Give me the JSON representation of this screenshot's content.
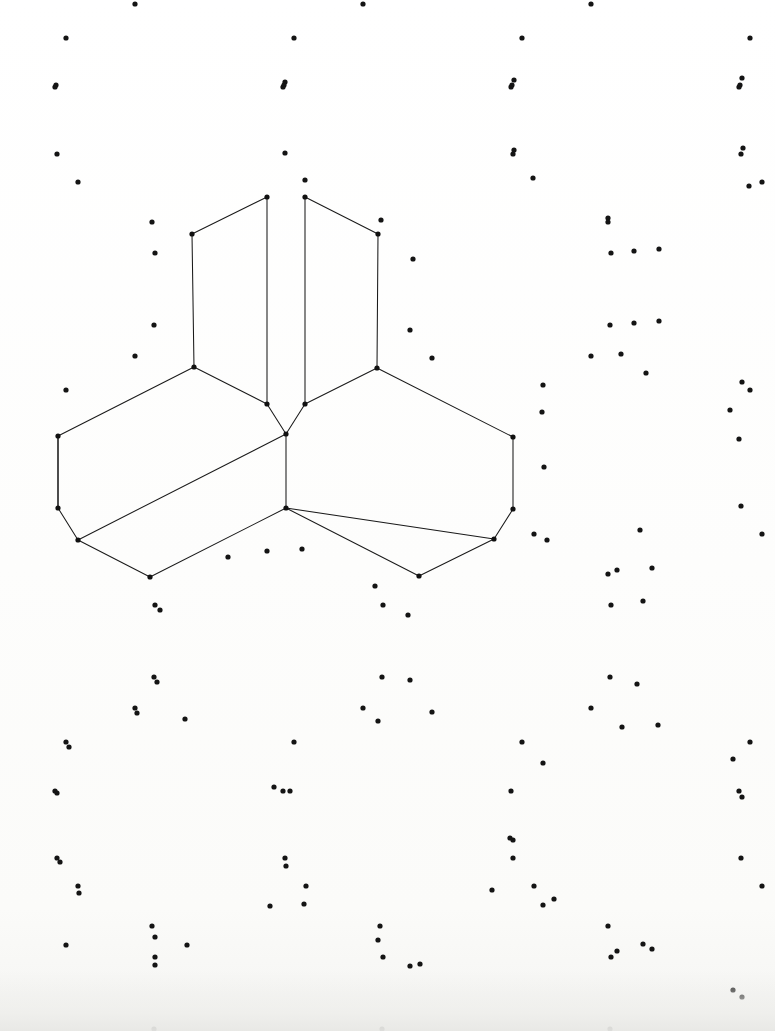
{
  "canvas": {
    "width": 775,
    "height": 1031,
    "background_color": "#fdfdfb",
    "description": "Isometric dot-grid paper drawing of a three-dimensional angled corner solid"
  },
  "style": {
    "dot_color": "#141414",
    "dot_radius": 2.6,
    "line_color": "#1a1a1a",
    "line_width": 1.05,
    "vertex_radius": 2.6
  },
  "grid": {
    "type": "sparse-isometric-motif",
    "motif_period_x": 228,
    "motif_period_y": 176,
    "motif_offsets": [
      [
        0,
        0
      ],
      [
        114,
        88
      ],
      [
        228,
        0
      ],
      [
        342,
        88
      ],
      [
        456,
        0
      ],
      [
        570,
        88
      ],
      [
        684,
        0
      ]
    ],
    "dots": [
      [
        56,
        85
      ],
      [
        285,
        82
      ],
      [
        514,
        80
      ],
      [
        742,
        78
      ],
      [
        57,
        154
      ],
      [
        285,
        153
      ],
      [
        514,
        150
      ],
      [
        743,
        148
      ],
      [
        78,
        182
      ],
      [
        305,
        180
      ],
      [
        533,
        178
      ],
      [
        749,
        186
      ],
      [
        152,
        222
      ],
      [
        381,
        220
      ],
      [
        608,
        218
      ],
      [
        155,
        253
      ],
      [
        413,
        259
      ],
      [
        634,
        251
      ],
      [
        659,
        249
      ],
      [
        154,
        325
      ],
      [
        410,
        330
      ],
      [
        634,
        323
      ],
      [
        659,
        321
      ],
      [
        135,
        356
      ],
      [
        432,
        358
      ],
      [
        621,
        354
      ],
      [
        646,
        373
      ],
      [
        66,
        390
      ],
      [
        543,
        385
      ],
      [
        742,
        382
      ],
      [
        542,
        412
      ],
      [
        730,
        410
      ],
      [
        544,
        467
      ],
      [
        547,
        540
      ],
      [
        640,
        530
      ],
      [
        267,
        551
      ],
      [
        302,
        549
      ],
      [
        228,
        557
      ],
      [
        375,
        586
      ],
      [
        617,
        570
      ],
      [
        652,
        568
      ],
      [
        160,
        610
      ],
      [
        408,
        615
      ],
      [
        643,
        601
      ],
      [
        157,
        682
      ],
      [
        410,
        680
      ],
      [
        637,
        684
      ],
      [
        137,
        713
      ],
      [
        185,
        719
      ],
      [
        378,
        721
      ],
      [
        432,
        712
      ],
      [
        622,
        727
      ],
      [
        658,
        725
      ],
      [
        69,
        747
      ],
      [
        543,
        763
      ],
      [
        733,
        759
      ],
      [
        57,
        793
      ],
      [
        274,
        787
      ],
      [
        290,
        791
      ],
      [
        510,
        838
      ],
      [
        1,
        0
      ],
      [
        60,
        862
      ],
      [
        286,
        866
      ],
      [
        513,
        840
      ],
      [
        742,
        797
      ],
      [
        79,
        893
      ],
      [
        270,
        906
      ],
      [
        304,
        904
      ],
      [
        492,
        890
      ],
      [
        554,
        899
      ],
      [
        742,
        997
      ],
      [
        155,
        937
      ],
      [
        187,
        945
      ],
      [
        378,
        940
      ],
      [
        420,
        964
      ],
      [
        617,
        951
      ],
      [
        652,
        949
      ],
      [
        155,
        965
      ],
      [
        410,
        966
      ],
      [
        643,
        944
      ],
      [
        66,
        945
      ],
      [
        543,
        905
      ],
      [
        733,
        990
      ]
    ]
  },
  "figure": {
    "name": "isometric-corner-solid",
    "vertices": [
      {
        "id": "A",
        "x": 267,
        "y": 197
      },
      {
        "id": "B",
        "x": 192,
        "y": 234
      },
      {
        "id": "C",
        "x": 194,
        "y": 367
      },
      {
        "id": "D",
        "x": 58,
        "y": 436
      },
      {
        "id": "E",
        "x": 58,
        "y": 508
      },
      {
        "id": "F",
        "x": 78,
        "y": 540
      },
      {
        "id": "G",
        "x": 150,
        "y": 577
      },
      {
        "id": "H",
        "x": 267,
        "y": 404
      },
      {
        "id": "I",
        "x": 286,
        "y": 434
      },
      {
        "id": "J",
        "x": 286,
        "y": 508
      },
      {
        "id": "K",
        "x": 305,
        "y": 197
      },
      {
        "id": "L",
        "x": 378,
        "y": 234
      },
      {
        "id": "M",
        "x": 377,
        "y": 368
      },
      {
        "id": "N",
        "x": 513,
        "y": 437
      },
      {
        "id": "O",
        "x": 513,
        "y": 509
      },
      {
        "id": "P",
        "x": 494,
        "y": 539
      },
      {
        "id": "Q",
        "x": 419,
        "y": 576
      },
      {
        "id": "R",
        "x": 305,
        "y": 404
      }
    ],
    "edges": [
      [
        "A",
        "B"
      ],
      [
        "B",
        "C"
      ],
      [
        "C",
        "D"
      ],
      [
        "D",
        "E"
      ],
      [
        "E",
        "F"
      ],
      [
        "F",
        "G"
      ],
      [
        "G",
        "J"
      ],
      [
        "J",
        "I"
      ],
      [
        "I",
        "F"
      ],
      [
        "A",
        "H"
      ],
      [
        "H",
        "I"
      ],
      [
        "K",
        "L"
      ],
      [
        "L",
        "M"
      ],
      [
        "M",
        "N"
      ],
      [
        "N",
        "O"
      ],
      [
        "O",
        "P"
      ],
      [
        "P",
        "Q"
      ],
      [
        "Q",
        "J"
      ],
      [
        "J",
        "P"
      ],
      [
        "K",
        "R"
      ],
      [
        "R",
        "I"
      ],
      [
        "C",
        "H"
      ],
      [
        "M",
        "R"
      ],
      [
        "E",
        "D"
      ]
    ]
  }
}
